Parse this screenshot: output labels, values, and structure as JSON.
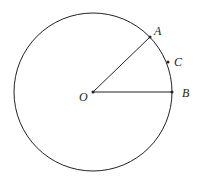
{
  "diagram": {
    "type": "circle-geometry",
    "circle": {
      "cx": 93,
      "cy": 92,
      "r": 80,
      "stroke": "#222222"
    },
    "points": {
      "O": {
        "label": "O",
        "x": 93,
        "y": 92,
        "label_x": 79,
        "label_y": 101
      },
      "A": {
        "label": "A",
        "x": 150,
        "y": 37,
        "label_x": 154,
        "label_y": 35
      },
      "C": {
        "label": "C",
        "x": 168,
        "y": 62,
        "label_x": 174,
        "label_y": 66
      },
      "B": {
        "label": "B",
        "x": 173,
        "y": 92,
        "label_x": 182,
        "label_y": 97
      }
    },
    "segments": [
      {
        "from": "O",
        "to": "A"
      },
      {
        "from": "O",
        "to": "B"
      }
    ]
  }
}
